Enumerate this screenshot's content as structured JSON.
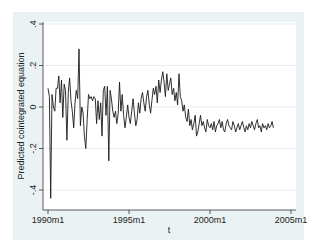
{
  "chart_data": {
    "type": "line",
    "title": "",
    "xlabel": "t",
    "ylabel": "Predicted cointegrated equation",
    "xlim": [
      "1990m1",
      "2005m1"
    ],
    "ylim": [
      -0.45,
      0.42
    ],
    "grid": true,
    "legend": "none",
    "x_ticks": [
      "1990m1",
      "1995m1",
      "2000m1",
      "2005m1"
    ],
    "y_ticks": [
      ".4",
      ".2",
      "0",
      "-.2",
      "-.4"
    ],
    "y_tick_values": [
      0.4,
      0.2,
      0,
      -0.2,
      -0.4
    ],
    "x_start": "1990m1",
    "x_end": "2003m12",
    "frequency": "monthly",
    "series": [
      {
        "name": "Predicted cointegrated equation",
        "color": "#1a1a1a",
        "values": [
          0.09,
          0.05,
          -0.44,
          0.06,
          0.0,
          -0.02,
          0.09,
          0.09,
          0.15,
          0.02,
          0.13,
          -0.05,
          0.11,
          0.08,
          -0.16,
          0.07,
          0.14,
          0.03,
          -0.02,
          -0.1,
          0.02,
          0.08,
          0.04,
          0.28,
          -0.09,
          0.0,
          -0.03,
          -0.14,
          -0.2,
          -0.06,
          0.06,
          0.04,
          0.05,
          0.03,
          0.05,
          0.04,
          -0.08,
          0.03,
          -0.06,
          0.02,
          -0.14,
          0.08,
          0.1,
          -0.04,
          0.1,
          -0.26,
          0.08,
          0.04,
          -0.02,
          -0.05,
          -0.02,
          -0.08,
          -0.03,
          0.12,
          -0.02,
          0.06,
          -0.04,
          -0.1,
          -0.05,
          0.01,
          -0.05,
          -0.08,
          -0.02,
          0.04,
          -0.03,
          -0.09,
          -0.06,
          0.02,
          -0.03,
          0.04,
          0.07,
          0.02,
          -0.02,
          0.05,
          0.08,
          0.01,
          -0.03,
          0.03,
          0.09,
          0.06,
          0.1,
          0.02,
          0.13,
          0.07,
          0.13,
          0.17,
          0.12,
          0.05,
          0.16,
          0.08,
          0.11,
          0.14,
          0.06,
          0.09,
          0.03,
          0.07,
          0.01,
          0.16,
          0.05,
          0.03,
          -0.02,
          0.01,
          -0.05,
          -0.07,
          -0.01,
          -0.09,
          -0.06,
          -0.11,
          -0.08,
          -0.04,
          -0.14,
          -0.12,
          -0.08,
          -0.04,
          -0.09,
          -0.07,
          -0.1,
          -0.12,
          -0.06,
          -0.09,
          -0.1,
          -0.08,
          -0.11,
          -0.07,
          -0.12,
          -0.09,
          -0.08,
          -0.06,
          -0.1,
          -0.07,
          -0.11,
          -0.12,
          -0.08,
          -0.06,
          -0.09,
          -0.1,
          -0.11,
          -0.07,
          -0.09,
          -0.12,
          -0.1,
          -0.08,
          -0.11,
          -0.09,
          -0.07,
          -0.1,
          -0.12,
          -0.09,
          -0.11,
          -0.08,
          -0.1,
          -0.07,
          -0.09,
          -0.11,
          -0.08,
          -0.06,
          -0.1,
          -0.09,
          -0.12,
          -0.08,
          -0.1,
          -0.09,
          -0.11,
          -0.08,
          -0.1,
          -0.09,
          -0.07,
          -0.1
        ]
      }
    ]
  },
  "axes": {
    "y_title": "Predicted cointegrated equation",
    "x_title": "t"
  },
  "colors": {
    "frame_bg": "#eaf2f3",
    "plot_bg": "#ffffff",
    "grid": "#e6eef0",
    "line": "#1a1a1a"
  }
}
